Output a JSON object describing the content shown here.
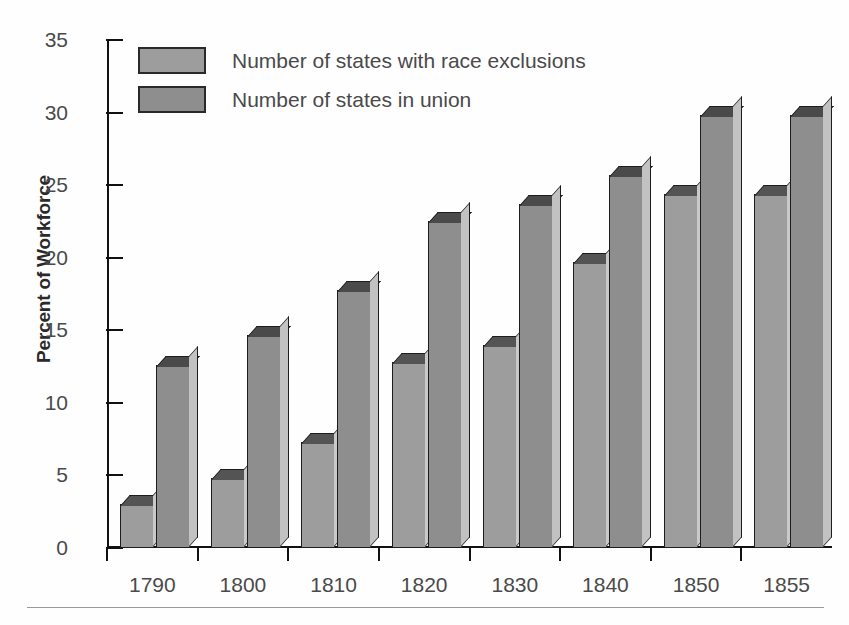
{
  "chart_data": {
    "type": "bar",
    "title": "",
    "xlabel": "",
    "ylabel": "Percent of Workforce",
    "categories": [
      "1790",
      "1800",
      "1810",
      "1820",
      "1830",
      "1840",
      "1850",
      "1855"
    ],
    "series": [
      {
        "name": "Number of states with race exclusions",
        "color": "#9d9d9d",
        "top_color": "#545454",
        "side_color": "#c9c9c9",
        "values": [
          3,
          4.8,
          7.3,
          12.8,
          14,
          19.7,
          24.4,
          24.4
        ]
      },
      {
        "name": "Number of states in union",
        "color": "#8e8e8e",
        "top_color": "#4a4a4a",
        "side_color": "#c2c2c2",
        "values": [
          12.6,
          14.7,
          17.8,
          22.5,
          23.7,
          25.7,
          29.8,
          29.8
        ]
      }
    ],
    "ylim": [
      0,
      35
    ],
    "yticks": [
      0,
      5,
      10,
      15,
      20,
      25,
      30,
      35
    ],
    "ytick_labels": [
      "0",
      "5",
      "10",
      "15",
      "20",
      "25",
      "30",
      "35"
    ],
    "grid": false,
    "legend_position": "top-left",
    "style": "3d-bars"
  },
  "legend": {
    "items": [
      {
        "label": "Number of states with race exclusions"
      },
      {
        "label": "Number of states in union"
      }
    ]
  },
  "axes": {
    "y_title": "Percent of Workforce"
  }
}
